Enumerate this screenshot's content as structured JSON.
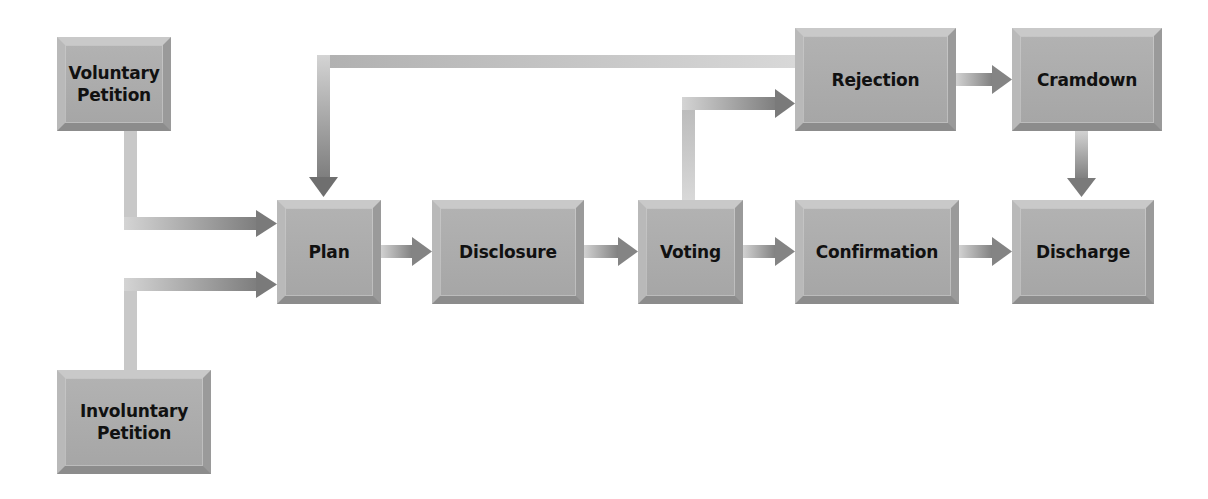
{
  "diagram": {
    "type": "flowchart",
    "title": "",
    "colors": {
      "box_face": "#a9a9a9",
      "box_bevel_light": "#c9c9c9",
      "box_bevel_dark": "#8c8c8c",
      "connector_light": "#d0d0d0",
      "connector_dark": "#7a7a7a",
      "text": "#111111",
      "background": "#ffffff"
    },
    "nodes": [
      {
        "id": "voluntary_petition",
        "label": "Voluntary\nPetition"
      },
      {
        "id": "involuntary_petition",
        "label": "Involuntary\nPetition"
      },
      {
        "id": "plan",
        "label": "Plan"
      },
      {
        "id": "disclosure",
        "label": "Disclosure"
      },
      {
        "id": "voting",
        "label": "Voting"
      },
      {
        "id": "confirmation",
        "label": "Confirmation"
      },
      {
        "id": "discharge",
        "label": "Discharge"
      },
      {
        "id": "rejection",
        "label": "Rejection"
      },
      {
        "id": "cramdown",
        "label": "Cramdown"
      }
    ],
    "edges": [
      {
        "from": "voluntary_petition",
        "to": "plan"
      },
      {
        "from": "involuntary_petition",
        "to": "plan"
      },
      {
        "from": "plan",
        "to": "disclosure"
      },
      {
        "from": "disclosure",
        "to": "voting"
      },
      {
        "from": "voting",
        "to": "confirmation"
      },
      {
        "from": "voting",
        "to": "rejection"
      },
      {
        "from": "confirmation",
        "to": "discharge"
      },
      {
        "from": "rejection",
        "to": "cramdown"
      },
      {
        "from": "cramdown",
        "to": "discharge"
      },
      {
        "from": "rejection",
        "to": "plan"
      }
    ]
  }
}
